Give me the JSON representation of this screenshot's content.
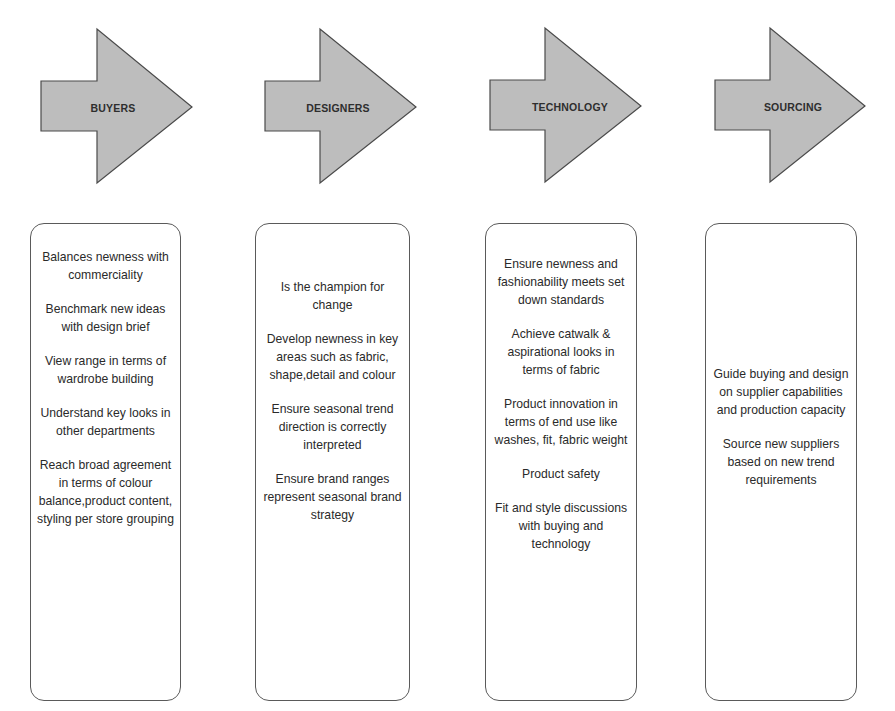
{
  "diagram": {
    "stages": [
      {
        "label": "BUYERS",
        "responsibilities": [
          "Balances newness with commerciality",
          "Benchmark new ideas with design brief",
          "View range in terms of wardrobe building",
          "Understand key looks in other departments",
          "Reach broad agreement in terms of colour balance,product content, styling per store grouping"
        ]
      },
      {
        "label": "DESIGNERS",
        "responsibilities": [
          "Is the champion for change",
          "Develop newness in key areas such as fabric, shape,detail and colour",
          "Ensure seasonal trend direction is correctly interpreted",
          "Ensure brand ranges represent seasonal brand strategy"
        ]
      },
      {
        "label": "TECHNOLOGY",
        "responsibilities": [
          "Ensure newness and fashionability meets set down standards",
          "Achieve catwalk & aspirational looks in terms of fabric",
          "Product innovation in terms of end use like washes, fit, fabric weight",
          "Product safety",
          "Fit and style discussions with buying and technology"
        ]
      },
      {
        "label": "SOURCING",
        "responsibilities": [
          "Guide buying and design on supplier capabilities and production capacity",
          "Source new suppliers based on new trend requirements"
        ]
      }
    ],
    "colors": {
      "arrow_fill": "#bdbdbd",
      "arrow_stroke": "#4a4a4a",
      "box_border": "#5a5a5a",
      "text": "#2a2a2a"
    }
  }
}
